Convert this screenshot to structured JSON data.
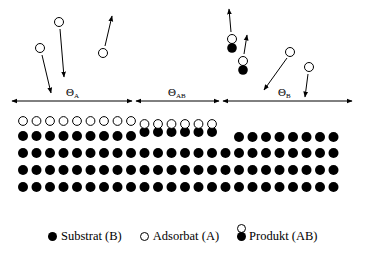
{
  "diagram": {
    "labels": {
      "theta_a": {
        "symbol": "Θ",
        "sub": "A"
      },
      "theta_ab": {
        "symbol": "Θ",
        "sub": "AB"
      },
      "theta_b": {
        "symbol": "Θ",
        "sub": "B"
      }
    },
    "regions": [
      {
        "name": "A",
        "x_start": 12,
        "x_end": 132
      },
      {
        "name": "AB",
        "x_start": 135,
        "x_end": 219
      },
      {
        "name": "B",
        "x_start": 222,
        "x_end": 352
      }
    ],
    "lattice": {
      "substrate_rows": 4,
      "atoms_per_row": 24,
      "region_a_adsorbates": 9,
      "region_ab_products": 6,
      "region_b_top_atoms": 8
    },
    "colors": {
      "substrate": "#000000",
      "adsorbate": "#ffffff",
      "outline": "#000000"
    }
  },
  "legend": {
    "substrate": "Substrat (B)",
    "adsorbate": "Adsorbat (A)",
    "product": "Produkt (AB)"
  }
}
